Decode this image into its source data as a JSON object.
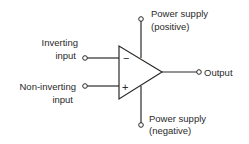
{
  "diagram": {
    "labels": {
      "inverting_line1": "Inverting",
      "inverting_line2": "input",
      "noninverting_line1": "Non-inverting",
      "noninverting_line2": "input",
      "output": "Output",
      "pos_supply_line1": "Power supply",
      "pos_supply_line2": "(positive)",
      "neg_supply_line1": "Power supply",
      "neg_supply_line2": "(negative)"
    },
    "signs": {
      "inverting": "−",
      "noninverting": "+"
    },
    "colors": {
      "line": "#2a2a2a",
      "background": "#ffffff"
    }
  }
}
